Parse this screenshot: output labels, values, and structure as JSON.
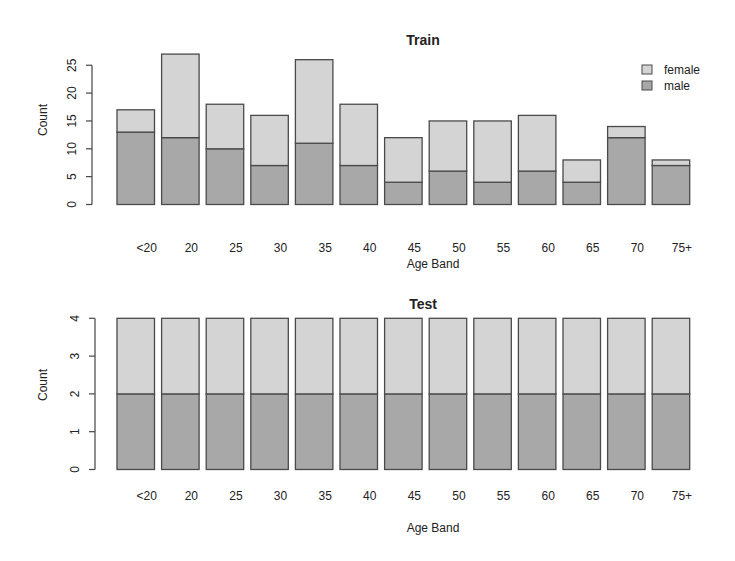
{
  "colors": {
    "female": "#d4d4d4",
    "male": "#a8a8a8",
    "border": "#4a4a4a",
    "text": "#222222"
  },
  "legend": {
    "items": [
      {
        "label": "female",
        "color": "#d4d4d4"
      },
      {
        "label": "male",
        "color": "#a8a8a8"
      }
    ]
  },
  "chart_data": [
    {
      "type": "bar",
      "stacked": true,
      "title": "Train",
      "xlabel": "Age Band",
      "ylabel": "Count",
      "categories": [
        "<20",
        "20",
        "25",
        "30",
        "35",
        "40",
        "45",
        "50",
        "55",
        "60",
        "65",
        "70",
        "75+"
      ],
      "series": [
        {
          "name": "male",
          "values": [
            13,
            12,
            10,
            7,
            11,
            7,
            4,
            6,
            4,
            6,
            4,
            12,
            7
          ]
        },
        {
          "name": "female",
          "values": [
            4,
            15,
            8,
            9,
            15,
            11,
            8,
            9,
            11,
            10,
            4,
            2,
            1
          ]
        }
      ],
      "totals": [
        17,
        27,
        18,
        16,
        26,
        18,
        12,
        15,
        15,
        16,
        8,
        14,
        8
      ],
      "yticks": [
        0,
        5,
        10,
        15,
        20,
        25
      ],
      "ylim": [
        0,
        27
      ],
      "grid": false,
      "legend_position": "topright"
    },
    {
      "type": "bar",
      "stacked": true,
      "title": "Test",
      "xlabel": "Age Band",
      "ylabel": "Count",
      "categories": [
        "<20",
        "20",
        "25",
        "30",
        "35",
        "40",
        "45",
        "50",
        "55",
        "60",
        "65",
        "70",
        "75+"
      ],
      "series": [
        {
          "name": "male",
          "values": [
            2,
            2,
            2,
            2,
            2,
            2,
            2,
            2,
            2,
            2,
            2,
            2,
            2
          ]
        },
        {
          "name": "female",
          "values": [
            2,
            2,
            2,
            2,
            2,
            2,
            2,
            2,
            2,
            2,
            2,
            2,
            2
          ]
        }
      ],
      "totals": [
        4,
        4,
        4,
        4,
        4,
        4,
        4,
        4,
        4,
        4,
        4,
        4,
        4
      ],
      "yticks": [
        0,
        1,
        2,
        3,
        4
      ],
      "ylim": [
        0,
        4
      ],
      "grid": false,
      "legend_position": "none"
    }
  ]
}
